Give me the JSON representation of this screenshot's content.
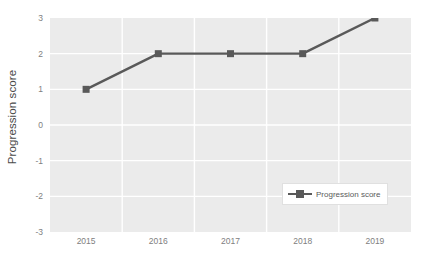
{
  "chart_data": {
    "type": "line",
    "title": "",
    "subtitle": "",
    "xlabel": "",
    "ylabel": "Progression score",
    "categories": [
      "2015",
      "2016",
      "2017",
      "2018",
      "2019"
    ],
    "series": [
      {
        "name": "Progression score",
        "values": [
          1,
          2,
          2,
          2,
          3
        ],
        "color": "#595959",
        "marker": "square"
      }
    ],
    "ylim": [
      -3,
      3
    ],
    "yticks": [
      3,
      2,
      1,
      0,
      -1,
      -2,
      -3
    ],
    "ytick_labels": [
      "3",
      "2",
      "1",
      "0",
      "-1",
      "-2",
      "-3"
    ],
    "xtick_labels": [
      "2015",
      "2016",
      "2017",
      "2018",
      "2019"
    ],
    "grid": true,
    "grid_color": "#ffffff",
    "plot_background": "#ebebeb",
    "legend_position": "lower-right-inside",
    "legend_entries": [
      "Progression score"
    ]
  },
  "axes": {
    "y_title": "Progression score",
    "y_ticks": [
      {
        "label": "3",
        "value": 3
      },
      {
        "label": "2",
        "value": 2
      },
      {
        "label": "1",
        "value": 1
      },
      {
        "label": "0",
        "value": 0
      },
      {
        "label": "-1",
        "value": -1
      },
      {
        "label": "-2",
        "value": -2
      },
      {
        "label": "-3",
        "value": -3
      }
    ],
    "x_ticks": [
      {
        "label": "2015"
      },
      {
        "label": "2016"
      },
      {
        "label": "2017"
      },
      {
        "label": "2018"
      },
      {
        "label": "2019"
      }
    ]
  },
  "legend": {
    "items": [
      {
        "label": "Progression score",
        "color": "#595959"
      }
    ]
  },
  "colors": {
    "series": "#595959",
    "plot_bg": "#ebebeb",
    "grid": "#ffffff",
    "tick_text": "#808080",
    "axis_title": "#4a4a4a",
    "legend_border": "#e0e0e0",
    "page_bg": "#ffffff"
  }
}
